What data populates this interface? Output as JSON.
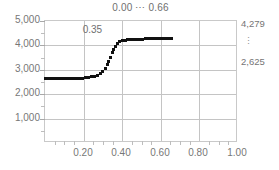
{
  "chart_data": {
    "type": "scatter",
    "title": "0.00 ⋯ 0.66",
    "xlabel": "",
    "ylabel": "",
    "xlim": [
      0.0,
      1.0
    ],
    "ylim": [
      0,
      5000
    ],
    "grid": true,
    "legend": "none",
    "marker": "square-dot",
    "marker_color": "#111111",
    "x_ticks": [
      "0.20",
      "0.40",
      "0.60",
      "0.80",
      "1.00"
    ],
    "x_tick_values": [
      0.2,
      0.4,
      0.6,
      0.8,
      1.0
    ],
    "y_ticks": [
      "1,000",
      "2,000",
      "3,000",
      "4,000",
      "5,000"
    ],
    "y_tick_values": [
      1000,
      2000,
      3000,
      4000,
      5000
    ],
    "annotations": [
      {
        "text": "0.35",
        "x": 0.33,
        "y": 4300
      }
    ],
    "right_axis_labels": {
      "top": "4,279",
      "ellipsis": "⋮",
      "bottom": "2,625"
    },
    "series": [
      {
        "name": "sigmoid",
        "x": [
          0.0,
          0.015,
          0.03,
          0.045,
          0.06,
          0.075,
          0.09,
          0.105,
          0.12,
          0.135,
          0.15,
          0.165,
          0.18,
          0.195,
          0.21,
          0.225,
          0.24,
          0.255,
          0.27,
          0.285,
          0.3,
          0.312,
          0.322,
          0.331,
          0.34,
          0.348,
          0.356,
          0.365,
          0.375,
          0.387,
          0.4,
          0.415,
          0.43,
          0.445,
          0.46,
          0.475,
          0.49,
          0.505,
          0.52,
          0.535,
          0.55,
          0.565,
          0.58,
          0.595,
          0.61,
          0.625,
          0.64,
          0.655
        ],
        "y": [
          2625,
          2625,
          2626,
          2627,
          2628,
          2629,
          2631,
          2633,
          2636,
          2639,
          2643,
          2648,
          2654,
          2662,
          2672,
          2686,
          2705,
          2732,
          2772,
          2836,
          2940,
          3065,
          3200,
          3350,
          3520,
          3690,
          3840,
          3965,
          4060,
          4140,
          4185,
          4212,
          4228,
          4240,
          4248,
          4254,
          4258,
          4262,
          4265,
          4268,
          4270,
          4272,
          4274,
          4275,
          4276,
          4277,
          4278,
          4279
        ]
      }
    ]
  }
}
